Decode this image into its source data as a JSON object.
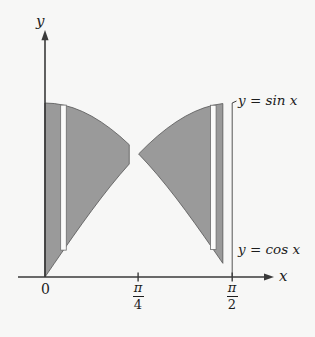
{
  "figure": {
    "title": "",
    "background_color": "#f7f7f6",
    "ink_color": "#1d1d1d",
    "shade_color": "#9a9a9a",
    "strip_color": "#fbfbfa"
  },
  "axes": {
    "y_label": "y",
    "x_label": "x",
    "x_ticks": [
      {
        "name": "origin",
        "label_plain": "0",
        "numerator": "",
        "denominator": "",
        "value": 0
      },
      {
        "name": "pi-over-4",
        "label_plain": "π/4",
        "numerator": "π",
        "denominator": "4",
        "value": 0.7853981634
      },
      {
        "name": "pi-over-2",
        "label_plain": "π/2",
        "numerator": "π",
        "denominator": "2",
        "value": 1.5707963268
      }
    ]
  },
  "curve_labels": {
    "sine": {
      "lhs": "y",
      "eq": "=",
      "rhs": "sin x",
      "full": "y = sin x"
    },
    "cosine": {
      "lhs": "y",
      "eq": "=",
      "rhs": "cos x",
      "full": "y = cos x"
    }
  },
  "chart_data": {
    "type": "area",
    "title": "",
    "xlabel": "x",
    "ylabel": "y",
    "xlim": [
      0,
      1.5707963268
    ],
    "ylim": [
      0,
      1.05
    ],
    "grid": false,
    "legend": "inline-curve-labels",
    "annotations": [
      "Region between y = sin x and y = cos x on [0, π/2] is shaded gray",
      "Curves intersect at x = π/4, y = √2/2 ≈ 0.7071",
      "Two vertical white representative strips drawn inside the shaded region"
    ],
    "series": [
      {
        "name": "y = sin x",
        "label": "y = sin x",
        "x": [
          0,
          0.0785,
          0.1571,
          0.2356,
          0.3142,
          0.3927,
          0.4712,
          0.5498,
          0.6283,
          0.7069,
          0.7854,
          0.8639,
          0.9425,
          1.021,
          1.0996,
          1.1781,
          1.2566,
          1.3352,
          1.4137,
          1.4923,
          1.5708
        ],
        "y": [
          0,
          0.0785,
          0.1564,
          0.2334,
          0.309,
          0.3827,
          0.454,
          0.5225,
          0.5878,
          0.6494,
          0.7071,
          0.7604,
          0.809,
          0.8526,
          0.891,
          0.9239,
          0.9511,
          0.9724,
          0.9877,
          0.9969,
          1.0
        ]
      },
      {
        "name": "y = cos x",
        "label": "y = cos x",
        "x": [
          0,
          0.0785,
          0.1571,
          0.2356,
          0.3142,
          0.3927,
          0.4712,
          0.5498,
          0.6283,
          0.7069,
          0.7854,
          0.8639,
          0.9425,
          1.021,
          1.0996,
          1.1781,
          1.2566,
          1.3352,
          1.4137,
          1.4923,
          1.5708
        ],
        "y": [
          1.0,
          0.9969,
          0.9877,
          0.9724,
          0.9511,
          0.9239,
          0.891,
          0.8526,
          0.809,
          0.7604,
          0.7071,
          0.6494,
          0.5878,
          0.5225,
          0.454,
          0.3827,
          0.309,
          0.2334,
          0.1564,
          0.0785,
          0.0
        ]
      }
    ],
    "shaded_regions": [
      {
        "name": "left-region",
        "x_from": 0,
        "x_to": 0.7853981634,
        "upper": "cos",
        "lower": "sin"
      },
      {
        "name": "right-region",
        "x_from": 0.7853981634,
        "x_to": 1.5707963268,
        "upper": "sin",
        "lower": "cos"
      }
    ],
    "strips": [
      {
        "name": "left-strip",
        "x": 0.155,
        "y_bottom": 0.1544,
        "y_top": 0.988
      },
      {
        "name": "right-strip",
        "x": 1.412,
        "y_bottom": 0.1581,
        "y_top": 0.9872
      }
    ]
  }
}
